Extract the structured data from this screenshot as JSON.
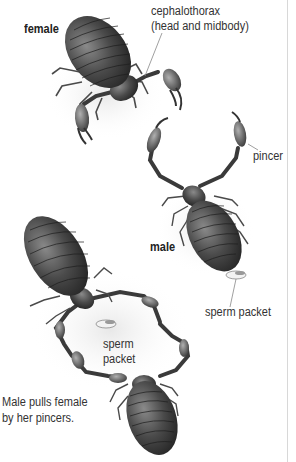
{
  "figure": {
    "labels": {
      "female": "female",
      "cephalothorax_line1": "cephalothorax",
      "cephalothorax_line2": "(head and midbody)",
      "pincer": "pincer",
      "male": "male",
      "sperm_packet_right": "sperm packet",
      "sperm_packet_center_line1": "sperm",
      "sperm_packet_center_line2": "packet",
      "caption_line1": "Male pulls female",
      "caption_line2": "by her pincers."
    },
    "colors": {
      "background": "#ffffff",
      "body_dark": "#3a3a3a",
      "body_mid": "#6a6a6a",
      "label_text": "#333333",
      "leader_line": "#888888"
    }
  }
}
